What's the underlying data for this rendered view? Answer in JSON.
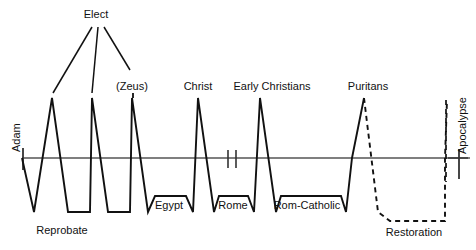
{
  "figure": {
    "type": "line-diagram",
    "background": "#ffffff",
    "stroke_color": "#111111",
    "axis_color": "#555555",
    "width": 476,
    "height": 250
  },
  "axis": {
    "name": "timeline-axis",
    "y": 158,
    "x_start": 22,
    "x_end": 470,
    "start_tick_label": "Adam",
    "end_tick_label": "Apocalypse",
    "break_marks": 2,
    "break_x": [
      228,
      236
    ]
  },
  "top_labels": [
    {
      "id": "elect",
      "text": "Elect",
      "x": 96,
      "y": 18
    },
    {
      "id": "zeus",
      "text": "(Zeus)",
      "x": 132,
      "y": 90
    },
    {
      "id": "christ",
      "text": "Christ",
      "x": 198,
      "y": 90
    },
    {
      "id": "early-christians",
      "text": "Early Christians",
      "x": 272,
      "y": 90
    },
    {
      "id": "puritans",
      "text": "Puritans",
      "x": 368,
      "y": 90
    }
  ],
  "bottom_labels": [
    {
      "id": "reprobate",
      "text": "Reprobate",
      "x": 62,
      "y": 234
    },
    {
      "id": "egypt",
      "text": "Egypt",
      "x": 169,
      "y": 209
    },
    {
      "id": "rome",
      "text": "Rome",
      "x": 233,
      "y": 209
    },
    {
      "id": "rom-catholic",
      "text": "Rom-Catholic",
      "x": 307,
      "y": 209
    },
    {
      "id": "restoration",
      "text": "Restoration",
      "x": 411,
      "y": 236
    }
  ],
  "rotated_labels": [
    {
      "id": "adam",
      "text": "Adam",
      "x": 22,
      "y": 152
    },
    {
      "id": "apocalypse",
      "text": "Apocalypse",
      "x": 462,
      "y": 158
    }
  ],
  "elect_connectors": {
    "name": "elect-fan-lines",
    "origin": {
      "x": 96,
      "y": 26
    },
    "targets": [
      {
        "x": 52,
        "y": 92
      },
      {
        "x": 92,
        "y": 92
      },
      {
        "x": 130,
        "y": 70
      }
    ]
  },
  "waveform_solid": {
    "name": "history-waveform-solid",
    "points": "22,158 34,212 52,98 68,212 90,212 92,98 108,212 130,212 132,98 148,212 155,196 186,196 193,212 198,98 214,212 219,196 248,196 254,212 260,98 276,212 281,196 341,196 346,212 352,158 364,98"
  },
  "waveform_dashed": {
    "name": "restoration-waveform-dashed",
    "points": "364,98 378,212 390,221 445,221 445,158 447,100",
    "dash": "5,4"
  }
}
